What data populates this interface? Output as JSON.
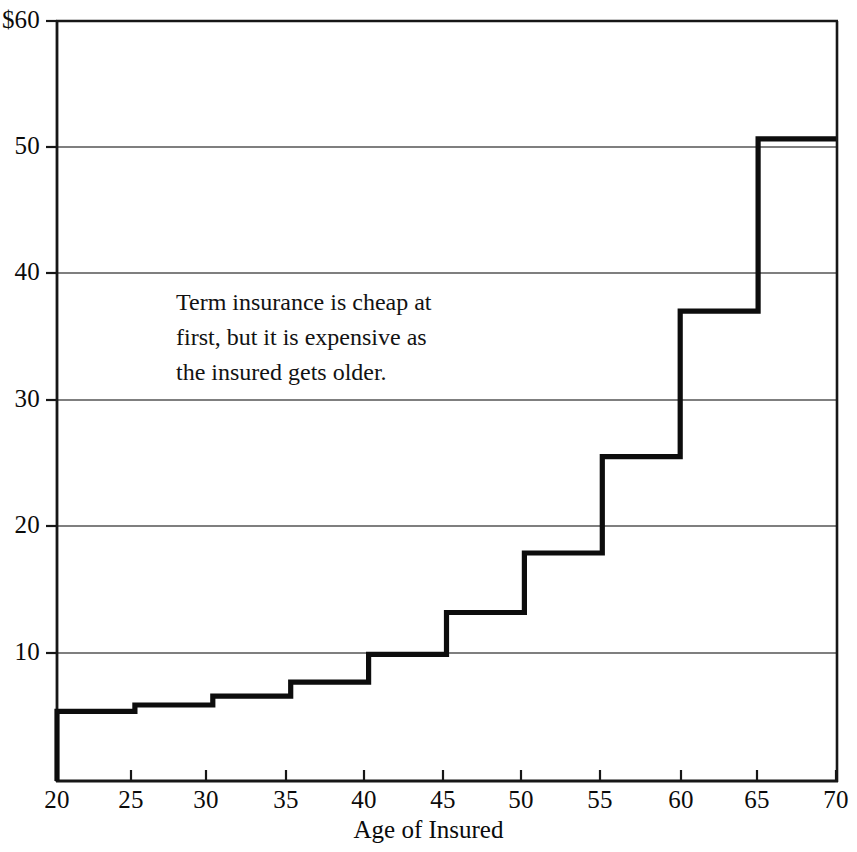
{
  "chart_data": {
    "type": "line",
    "subtype": "step-post",
    "title": "",
    "xlabel": "Age of Insured",
    "ylabel": "",
    "xlim": [
      20,
      70
    ],
    "ylim": [
      0,
      60
    ],
    "xticks": [
      "20",
      "25",
      "30",
      "35",
      "40",
      "45",
      "50",
      "55",
      "60",
      "65",
      "70"
    ],
    "xtick_values": [
      20,
      25,
      30,
      35,
      40,
      45,
      50,
      55,
      60,
      65,
      70
    ],
    "yticks": [
      "10",
      "20",
      "30",
      "40",
      "50",
      "$60"
    ],
    "ytick_values": [
      10,
      20,
      30,
      40,
      50,
      60
    ],
    "grid": "horizontal",
    "legend": "none",
    "series": [
      {
        "name": "Term insurance annual premium",
        "x": [
          20,
          25,
          30,
          35,
          40,
          45,
          50,
          55,
          60,
          65,
          70
        ],
        "values": [
          5.5,
          6.0,
          6.7,
          7.8,
          10.0,
          13.3,
          18.0,
          25.6,
          37.1,
          50.7,
          50.7
        ],
        "steps": [
          {
            "age_from": 20,
            "age_to": 25,
            "value": 5.5
          },
          {
            "age_from": 25,
            "age_to": 30,
            "value": 6.0
          },
          {
            "age_from": 30,
            "age_to": 35,
            "value": 6.7
          },
          {
            "age_from": 35,
            "age_to": 40,
            "value": 7.8
          },
          {
            "age_from": 40,
            "age_to": 45,
            "value": 10.0
          },
          {
            "age_from": 45,
            "age_to": 50,
            "value": 13.3
          },
          {
            "age_from": 50,
            "age_to": 55,
            "value": 18.0
          },
          {
            "age_from": 55,
            "age_to": 60,
            "value": 25.6
          },
          {
            "age_from": 60,
            "age_to": 65,
            "value": 37.1
          },
          {
            "age_from": 65,
            "age_to": 70,
            "value": 50.7
          }
        ]
      }
    ],
    "annotations": [
      {
        "lines": [
          "Term insurance is cheap at",
          "first, but it is expensive as",
          "the insured gets older."
        ]
      }
    ],
    "colors": {
      "line": "#0d0d0d",
      "axis": "#1a1a1a",
      "grid": "#4a4a4a",
      "background": "#ffffff",
      "text": "#0b0b0b"
    }
  }
}
